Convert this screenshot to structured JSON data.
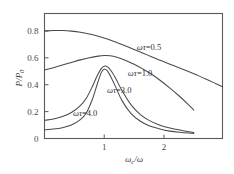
{
  "chart_data": {
    "type": "line",
    "title": "",
    "subtitle": "",
    "xlabel": "ωc/ω",
    "ylabel": "P/P0",
    "xlabel_parts": {
      "omega": "ω",
      "sub": "c",
      "slash_omega": "/ω"
    },
    "ylabel_parts": {
      "p": "P",
      "slash_p": "/P",
      "sub": "0"
    },
    "xlim": [
      0,
      2.98
    ],
    "ylim": [
      0,
      0.93
    ],
    "xticks": [
      1,
      2
    ],
    "xticklabels": [
      "1",
      "2"
    ],
    "yticks": [
      0,
      0.2,
      0.4,
      0.6,
      0.8
    ],
    "yticklabels": [
      "0",
      "0.2",
      "0.4",
      "0.6",
      "0.8"
    ],
    "grid": false,
    "legend": "inline-annotations",
    "series": [
      {
        "name": "ωτ=0.5",
        "label_prefix": "ωτ",
        "label_value": "=0.5",
        "x": [
          0.0,
          0.15,
          0.3,
          0.45,
          0.6,
          0.75,
          0.9,
          1.05,
          1.2,
          1.35,
          1.5,
          1.65,
          1.8,
          1.95,
          2.1,
          2.25,
          2.4,
          2.55,
          2.7,
          2.85,
          2.98
        ],
        "y": [
          0.8,
          0.803,
          0.803,
          0.799,
          0.791,
          0.778,
          0.761,
          0.74,
          0.716,
          0.69,
          0.663,
          0.635,
          0.607,
          0.58,
          0.553,
          0.527,
          0.5,
          0.472,
          0.443,
          0.412,
          0.385
        ]
      },
      {
        "name": "ωτ=1.0",
        "label_prefix": "ωτ",
        "label_value": "=1.0",
        "x": [
          0.0,
          0.15,
          0.3,
          0.45,
          0.6,
          0.75,
          0.9,
          1.0,
          1.1,
          1.2,
          1.35,
          1.5,
          1.65,
          1.8,
          1.95,
          2.1,
          2.25,
          2.4,
          2.5
        ],
        "y": [
          0.51,
          0.527,
          0.546,
          0.566,
          0.585,
          0.601,
          0.613,
          0.617,
          0.615,
          0.606,
          0.583,
          0.552,
          0.516,
          0.476,
          0.428,
          0.375,
          0.318,
          0.256,
          0.212
        ]
      },
      {
        "name": "ωτ=3.0",
        "label_prefix": "ωτ",
        "label_value": "=3.0",
        "x": [
          0.0,
          0.15,
          0.3,
          0.45,
          0.6,
          0.7,
          0.8,
          0.88,
          0.95,
          1.0,
          1.05,
          1.12,
          1.2,
          1.3,
          1.45,
          1.6,
          1.75,
          1.9,
          2.1,
          2.3,
          2.5
        ],
        "y": [
          0.135,
          0.145,
          0.163,
          0.193,
          0.245,
          0.3,
          0.385,
          0.465,
          0.52,
          0.538,
          0.535,
          0.5,
          0.44,
          0.355,
          0.25,
          0.18,
          0.135,
          0.105,
          0.078,
          0.06,
          0.045
        ]
      },
      {
        "name": "ωτ=4.0",
        "label_prefix": "ωτ",
        "label_value": "=4.0",
        "x": [
          0.0,
          0.15,
          0.3,
          0.45,
          0.6,
          0.7,
          0.8,
          0.88,
          0.95,
          1.0,
          1.05,
          1.12,
          1.2,
          1.3,
          1.45,
          1.6,
          1.75,
          1.9,
          2.1,
          2.3,
          2.5
        ],
        "y": [
          0.065,
          0.07,
          0.08,
          0.1,
          0.14,
          0.19,
          0.29,
          0.4,
          0.49,
          0.515,
          0.505,
          0.45,
          0.375,
          0.28,
          0.185,
          0.13,
          0.095,
          0.075,
          0.055,
          0.045,
          0.038
        ]
      }
    ],
    "annotations": [
      {
        "text": "ωτ=0.5",
        "x": 1.75,
        "y": 0.655
      },
      {
        "text": "ωτ=1.0",
        "x": 1.6,
        "y": 0.465
      },
      {
        "text": "ωτ=3.0",
        "x": 1.25,
        "y": 0.335
      },
      {
        "text": "ωτ=4.0",
        "x": 0.68,
        "y": 0.165
      }
    ],
    "colors": {
      "curve": "#4a4a4a",
      "axis": "#5a5a5a",
      "background": "#ffffff"
    }
  }
}
